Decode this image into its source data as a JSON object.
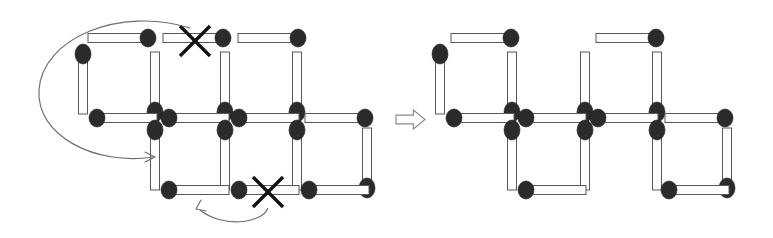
{
  "figure": {
    "background_color": "#ffffff",
    "width": 773,
    "height": 238
  },
  "style": {
    "stick_body_fill": "#fdfdfd",
    "stick_body_stroke": "#58585a",
    "stick_head_color": "#2b2b2e",
    "cross_color": "#121214",
    "motion_arrow_color": "#6d6d70",
    "transform_arrow_fill": "#ffffff",
    "transform_arrow_stroke": "#8a8a8d",
    "stick_length": 62,
    "stick_thickness": 9,
    "head_radius_x": 8,
    "head_radius_y": 9
  },
  "left_figure": {
    "label": "initial-arrangement",
    "matches": [
      {
        "id": "L-top-1",
        "orientation": "horizontal",
        "x": 88,
        "y": 38,
        "head": "right",
        "crossed": false
      },
      {
        "id": "L-top-2",
        "orientation": "horizontal",
        "x": 163,
        "y": 38,
        "head": "right",
        "crossed": true
      },
      {
        "id": "L-top-3",
        "orientation": "horizontal",
        "x": 238,
        "y": 38,
        "head": "right",
        "crossed": false
      },
      {
        "id": "L-up-v1",
        "orientation": "vertical",
        "x": 83,
        "y": 52,
        "head": "top",
        "crossed": false
      },
      {
        "id": "L-up-v2",
        "orientation": "vertical",
        "x": 155,
        "y": 52,
        "head": "bottom",
        "crossed": false
      },
      {
        "id": "L-up-v3",
        "orientation": "vertical",
        "x": 225,
        "y": 52,
        "head": "bottom",
        "crossed": false
      },
      {
        "id": "L-up-v4",
        "orientation": "vertical",
        "x": 297,
        "y": 52,
        "head": "bottom",
        "crossed": false
      },
      {
        "id": "L-mid-1",
        "orientation": "horizontal",
        "x": 95,
        "y": 118,
        "head": "left",
        "crossed": false
      },
      {
        "id": "L-mid-2",
        "orientation": "horizontal",
        "x": 167,
        "y": 118,
        "head": "left",
        "crossed": false
      },
      {
        "id": "L-mid-3",
        "orientation": "horizontal",
        "x": 237,
        "y": 118,
        "head": "left",
        "crossed": false
      },
      {
        "id": "L-mid-4",
        "orientation": "horizontal",
        "x": 305,
        "y": 118,
        "head": "right",
        "crossed": false
      },
      {
        "id": "L-lo-v1",
        "orientation": "vertical",
        "x": 155,
        "y": 128,
        "head": "top",
        "crossed": false
      },
      {
        "id": "L-lo-v2",
        "orientation": "vertical",
        "x": 225,
        "y": 128,
        "head": "top",
        "crossed": false
      },
      {
        "id": "L-lo-v3",
        "orientation": "vertical",
        "x": 297,
        "y": 128,
        "head": "top",
        "crossed": false
      },
      {
        "id": "L-lo-v4",
        "orientation": "vertical",
        "x": 367,
        "y": 128,
        "head": "bottom",
        "crossed": false
      },
      {
        "id": "L-bot-1",
        "orientation": "horizontal",
        "x": 167,
        "y": 190,
        "head": "left",
        "crossed": false
      },
      {
        "id": "L-bot-2",
        "orientation": "horizontal",
        "x": 237,
        "y": 190,
        "head": "left",
        "crossed": true
      },
      {
        "id": "L-bot-3",
        "orientation": "horizontal",
        "x": 307,
        "y": 190,
        "head": "left",
        "crossed": false
      }
    ],
    "crosses": [
      {
        "id": "cross-top",
        "cx": 195,
        "cy": 41,
        "size": 15
      },
      {
        "id": "cross-bottom",
        "cx": 268,
        "cy": 192,
        "size": 15
      }
    ],
    "motion_arrows": [
      {
        "id": "arrow-top-match-move",
        "path": "M 190 28 C 120 6 42 38 39 90 C 36 136 96 166 153 157",
        "head": "M 145 152 L 155 157 L 145 162"
      },
      {
        "id": "arrow-bottom-match-move",
        "path": "M 268 208 C 262 224 222 228 200 210",
        "head": "M 201 200 L 196 209 L 206 211"
      }
    ]
  },
  "transform_arrow": {
    "id": "result-arrow",
    "direction": "right",
    "x": 396,
    "y": 110,
    "width": 29,
    "height": 19
  },
  "right_figure": {
    "label": "solved-arrangement",
    "matches": [
      {
        "id": "R-top-1",
        "orientation": "horizontal",
        "x": 451,
        "y": 38,
        "head": "right",
        "crossed": false
      },
      {
        "id": "R-top-3",
        "orientation": "horizontal",
        "x": 596,
        "y": 38,
        "head": "right",
        "crossed": false
      },
      {
        "id": "R-up-v1",
        "orientation": "vertical",
        "x": 440,
        "y": 52,
        "head": "top",
        "crossed": false
      },
      {
        "id": "R-up-v2",
        "orientation": "vertical",
        "x": 512,
        "y": 52,
        "head": "bottom",
        "crossed": false
      },
      {
        "id": "R-up-v3",
        "orientation": "vertical",
        "x": 585,
        "y": 52,
        "head": "bottom",
        "crossed": false
      },
      {
        "id": "R-up-v4",
        "orientation": "vertical",
        "x": 657,
        "y": 52,
        "head": "bottom",
        "crossed": false
      },
      {
        "id": "R-mid-1",
        "orientation": "horizontal",
        "x": 452,
        "y": 118,
        "head": "left",
        "crossed": false
      },
      {
        "id": "R-mid-2",
        "orientation": "horizontal",
        "x": 524,
        "y": 118,
        "head": "left",
        "crossed": false
      },
      {
        "id": "R-mid-3",
        "orientation": "horizontal",
        "x": 596,
        "y": 118,
        "head": "left",
        "crossed": false
      },
      {
        "id": "R-mid-4",
        "orientation": "horizontal",
        "x": 665,
        "y": 118,
        "head": "right",
        "crossed": false
      },
      {
        "id": "R-lo-v1",
        "orientation": "vertical",
        "x": 512,
        "y": 128,
        "head": "top",
        "crossed": false
      },
      {
        "id": "R-lo-v2",
        "orientation": "vertical",
        "x": 585,
        "y": 128,
        "head": "top",
        "crossed": false
      },
      {
        "id": "R-lo-v3",
        "orientation": "vertical",
        "x": 657,
        "y": 128,
        "head": "top",
        "crossed": false
      },
      {
        "id": "R-lo-v4",
        "orientation": "vertical",
        "x": 727,
        "y": 128,
        "head": "bottom",
        "crossed": false
      },
      {
        "id": "R-bot-1",
        "orientation": "horizontal",
        "x": 524,
        "y": 190,
        "head": "left",
        "crossed": false
      },
      {
        "id": "R-bot-3",
        "orientation": "horizontal",
        "x": 667,
        "y": 190,
        "head": "left",
        "crossed": false
      }
    ]
  }
}
